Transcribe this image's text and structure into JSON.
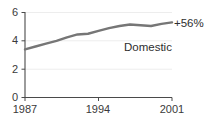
{
  "chart_data": {
    "type": "line",
    "title": "",
    "subtitle": "",
    "xlabel": "",
    "ylabel": "",
    "xlim": [
      1987,
      2001
    ],
    "ylim": [
      0,
      6
    ],
    "grid": true,
    "legend": "none",
    "x_ticks": [
      "1987",
      "1994",
      "2001"
    ],
    "x_tick_values": [
      1987,
      1994,
      2001
    ],
    "y_ticks": [
      "0",
      "2",
      "4",
      "6"
    ],
    "y_tick_values": [
      0,
      2,
      4,
      6
    ],
    "series": [
      {
        "name": "Domestic",
        "color": "#767676",
        "x": [
          1987,
          1988,
          1989,
          1990,
          1991,
          1992,
          1993,
          1994,
          1995,
          1996,
          1997,
          1998,
          1999,
          2000,
          2001
        ],
        "values": [
          3.4,
          3.6,
          3.8,
          4.0,
          4.25,
          4.45,
          4.5,
          4.7,
          4.9,
          5.05,
          5.15,
          5.1,
          5.05,
          5.2,
          5.3
        ]
      }
    ],
    "annotations": [
      {
        "text": "+56%",
        "x": 2001,
        "y": 5.3,
        "position": "end-right"
      },
      {
        "text": "Domestic",
        "x": 1997,
        "y": 3.6,
        "position": "inside"
      }
    ]
  },
  "axis": {
    "y_labels": [
      "6",
      "4",
      "2",
      "0"
    ],
    "x_labels": [
      "1987",
      "1994",
      "2001"
    ]
  },
  "labels": {
    "series_name": "Domestic",
    "end_annotation": "+56%"
  },
  "colors": {
    "line": "#767676",
    "axis": "#4a4a4a",
    "grid": "#ededed",
    "text": "#3a3a3a",
    "background": "#ffffff"
  }
}
